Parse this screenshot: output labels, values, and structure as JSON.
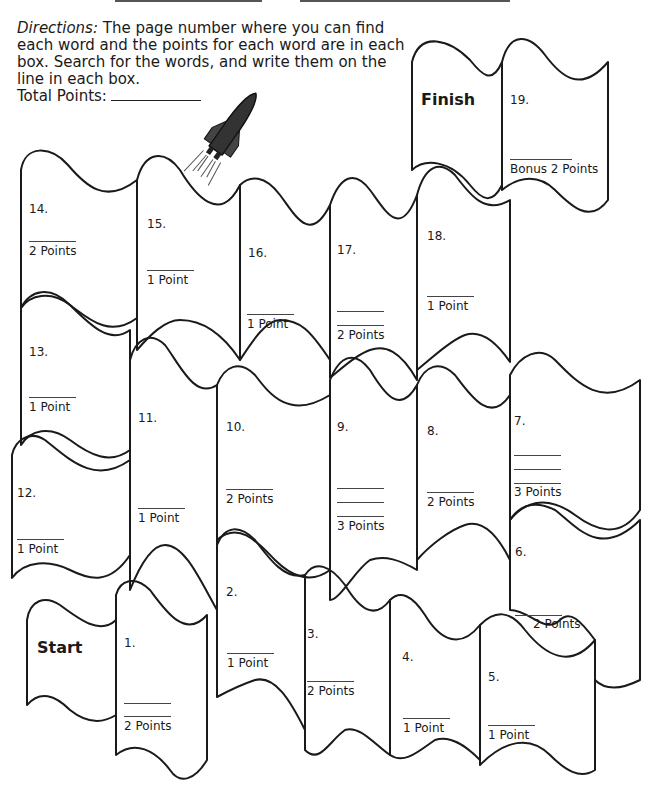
{
  "header": {
    "directions_label": "Directions:",
    "directions_text": " The page number where you can find each word and the points for each word are in each box. Search for the words, and write them on the line in each box.",
    "total_points_label": "Total Points:"
  },
  "board": {
    "start_label": "Start",
    "finish_label": "Finish",
    "boxes": [
      {
        "number": "1.",
        "lines": 2,
        "points": "2 Points"
      },
      {
        "number": "2.",
        "lines": 1,
        "points": "1 Point"
      },
      {
        "number": "3.",
        "lines": 1,
        "points": "2 Points"
      },
      {
        "number": "4.",
        "lines": 1,
        "points": "1 Point"
      },
      {
        "number": "5.",
        "lines": 1,
        "points": "1 Point"
      },
      {
        "number": "6.",
        "lines": 1,
        "points": "2 Points"
      },
      {
        "number": "7.",
        "lines": 3,
        "points": "3 Points"
      },
      {
        "number": "8.",
        "lines": 1,
        "points": "2 Points"
      },
      {
        "number": "9.",
        "lines": 3,
        "points": "3 Points"
      },
      {
        "number": "10.",
        "lines": 1,
        "points": "2 Points"
      },
      {
        "number": "11.",
        "lines": 1,
        "points": "1 Point"
      },
      {
        "number": "12.",
        "lines": 1,
        "points": "1 Point"
      },
      {
        "number": "13.",
        "lines": 1,
        "points": "1 Point"
      },
      {
        "number": "14.",
        "lines": 1,
        "points": "2 Points"
      },
      {
        "number": "15.",
        "lines": 1,
        "points": "1 Point"
      },
      {
        "number": "16.",
        "lines": 1,
        "points": "1 Point"
      },
      {
        "number": "17.",
        "lines": 2,
        "points": "2 Points"
      },
      {
        "number": "18.",
        "lines": 1,
        "points": "1 Point"
      },
      {
        "number": "19.",
        "lines": 1,
        "points": "Bonus 2 Points"
      }
    ]
  },
  "illustration": {
    "icon": "rocket-shuttle-icon"
  },
  "colors": {
    "ink": "#1a1a1a",
    "background": "#ffffff"
  }
}
